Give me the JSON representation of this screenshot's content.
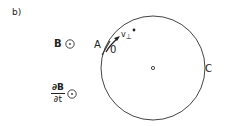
{
  "figure": {
    "panel_label": "b)",
    "field_label": "B",
    "field_symbol": "out-of-page (⊙)",
    "rate_label": {
      "numerator": "∂B",
      "denominator": "∂t"
    },
    "point_A": "A",
    "point_O": "0",
    "velocity_label": "v",
    "velocity_subscript": "⊥",
    "particle_marker": "*",
    "orbit_label": "C",
    "colors": {
      "stroke": "#333333",
      "background": "#ffffff"
    }
  }
}
